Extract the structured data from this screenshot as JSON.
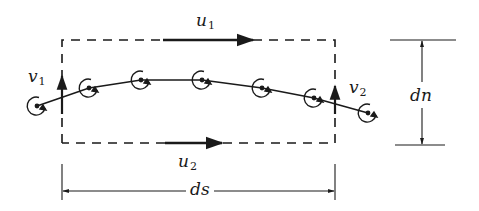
{
  "diagram": {
    "colors": {
      "ink": "#1a1a1a",
      "background": "#ffffff"
    },
    "control_volume": {
      "left": 62,
      "right": 335,
      "top": 40,
      "bottom": 143,
      "style": "dashed"
    },
    "labels": {
      "u1": {
        "base": "u",
        "sub": "1"
      },
      "u2": {
        "base": "u",
        "sub": "2"
      },
      "v1": {
        "base": "v",
        "sub": "1"
      },
      "v2": {
        "base": "v",
        "sub": "2"
      },
      "ds": "ds",
      "dn": "dn"
    },
    "velocity_arrows": [
      {
        "name": "u1",
        "x1": 163,
        "y1": 40,
        "x2": 253,
        "y2": 40
      },
      {
        "name": "u2",
        "x1": 165,
        "y1": 143,
        "x2": 222,
        "y2": 143
      },
      {
        "name": "v1",
        "x1": 62,
        "y1": 112,
        "x2": 62,
        "y2": 76
      },
      {
        "name": "v2",
        "x1": 335,
        "y1": 112,
        "x2": 335,
        "y2": 86
      }
    ],
    "vortex_line_points": [
      [
        37,
        106
      ],
      [
        89,
        88
      ],
      [
        141,
        80
      ],
      [
        202,
        80
      ],
      [
        262,
        88
      ],
      [
        314,
        98
      ],
      [
        368,
        113
      ]
    ],
    "vortices": [
      {
        "cx": 37,
        "cy": 106
      },
      {
        "cx": 89,
        "cy": 88
      },
      {
        "cx": 141,
        "cy": 80
      },
      {
        "cx": 202,
        "cy": 80
      },
      {
        "cx": 262,
        "cy": 88
      },
      {
        "cx": 314,
        "cy": 98
      },
      {
        "cx": 368,
        "cy": 113
      }
    ]
  }
}
